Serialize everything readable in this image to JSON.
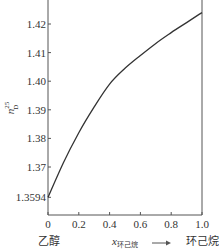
{
  "chart_data": {
    "type": "line",
    "title": "",
    "xlabel": "x环己烷",
    "xlabel_main": "x",
    "xlabel_sub": "环己烷",
    "ylabel": "n_D^25",
    "ylabel_main": "n",
    "ylabel_sub": "D",
    "ylabel_sup": "25",
    "xlim": [
      0,
      1.0
    ],
    "ylim": [
      1.3594,
      1.43
    ],
    "x_ticks": [
      "0",
      "0.2",
      "0.4",
      "0.6",
      "0.8",
      "1.0"
    ],
    "y_ticks": [
      "1.3594",
      "1.37",
      "1.38",
      "1.39",
      "1.40",
      "1.41",
      "1.42"
    ],
    "x_left_annotation": "乙醇",
    "x_right_annotation": "环己烷",
    "grid": false,
    "legend": null,
    "series": [
      {
        "name": "refractive index",
        "x": [
          0,
          0.1,
          0.2,
          0.3,
          0.4,
          0.5,
          0.6,
          0.7,
          0.8,
          0.9,
          1.0
        ],
        "values": [
          1.3594,
          1.3715,
          1.382,
          1.391,
          1.399,
          1.4045,
          1.409,
          1.4132,
          1.417,
          1.4205,
          1.424
        ]
      }
    ]
  },
  "colors": {
    "axis": "#555555",
    "line": "#333333",
    "text": "#333333"
  }
}
